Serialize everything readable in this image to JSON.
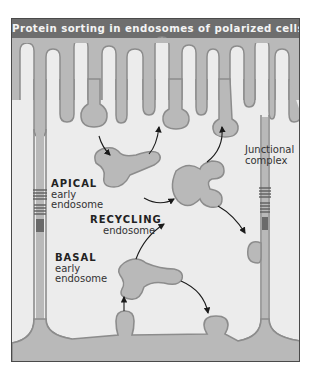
{
  "figure": {
    "title": "Protein sorting in endosomes of polarized cells"
  },
  "labels": {
    "apical": {
      "name": "APICAL",
      "line1": "early",
      "line2": "endosome"
    },
    "recycling": {
      "name": "RECYCLING",
      "line1": "endosome"
    },
    "basal": {
      "name": "BASAL",
      "line1": "early",
      "line2": "endosome"
    },
    "junctional": {
      "line1": "Junctional",
      "line2": "complex"
    }
  },
  "colors": {
    "title_bg": "#6e6e6e",
    "title_text": "#f4f4f4",
    "cytoplasm": "#ececec",
    "membrane_fill": "#b9b9b9",
    "membrane_stroke": "#8c8c8c",
    "arrow": "#1a1a1a",
    "frame": "#4a4a4a"
  }
}
